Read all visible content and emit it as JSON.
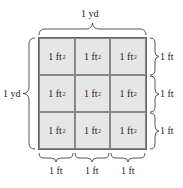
{
  "diagram": {
    "top_label": "1 yd",
    "left_label": "1 yd",
    "cell_label": "1 ft",
    "cell_exponent": "2",
    "cells": [
      {
        "label": "1 ft",
        "exp": "2"
      },
      {
        "label": "1 ft",
        "exp": "2"
      },
      {
        "label": "1 ft",
        "exp": "2"
      },
      {
        "label": "1 ft",
        "exp": "2"
      },
      {
        "label": "1 ft",
        "exp": "2"
      },
      {
        "label": "1 ft",
        "exp": "2"
      },
      {
        "label": "1 ft",
        "exp": "2"
      },
      {
        "label": "1 ft",
        "exp": "2"
      },
      {
        "label": "1 ft",
        "exp": "2"
      }
    ],
    "right_labels": [
      "1 ft",
      "1 ft",
      "1 ft"
    ],
    "bottom_labels": [
      "1 ft",
      "1 ft",
      "1 ft"
    ],
    "colors": {
      "cell_fill": "#e6e6e6",
      "border": "#666666",
      "text": "#222222"
    }
  }
}
